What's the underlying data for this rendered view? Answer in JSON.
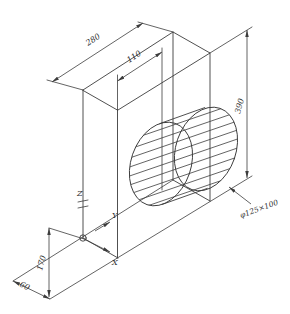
{
  "drawing": {
    "background": "#ffffff",
    "line_color": "#3c3c3c",
    "text_color": "#2f2f2f",
    "dimensions": {
      "depth": "280",
      "width": "110",
      "height": "390",
      "origin_height": "170",
      "origin_offset": "60",
      "cylinder": "φ125×100"
    },
    "axes": {
      "x": "X",
      "y": "Y",
      "z": "Z"
    }
  }
}
